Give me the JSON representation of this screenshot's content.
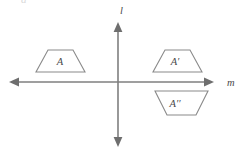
{
  "figure": {
    "background_color": "#ffffff",
    "line_color": "#7f7f7f",
    "shape_stroke_color": "#8a8a8a",
    "label_color": "#4a4a4a",
    "width": 247,
    "height": 155,
    "partial_glyph_top": "a"
  },
  "axes": {
    "origin": {
      "x": 118,
      "y": 82
    },
    "vertical": {
      "label": "l",
      "label_x": 120,
      "label_y": 14,
      "x": 118,
      "y_top": 22,
      "y_bottom": 147,
      "arrow_top": true,
      "arrow_bottom": true
    },
    "horizontal": {
      "label": "m",
      "label_x": 227,
      "label_y": 86,
      "y": 82,
      "x_left": 9,
      "x_right": 214,
      "arrow_left": true,
      "arrow_right": true
    }
  },
  "shapes": [
    {
      "name": "trapezoid-a",
      "label": "A",
      "primes": "",
      "quadrant": "II",
      "orientation": "narrow-top",
      "points": "48,50 73,50 85,72 36,72",
      "label_x": 60,
      "label_y": 65
    },
    {
      "name": "trapezoid-a-prime",
      "label": "A",
      "primes": "′",
      "quadrant": "I",
      "orientation": "narrow-top",
      "points": "165,50 190,50 202,72 153,72",
      "label_x": 175,
      "label_y": 65
    },
    {
      "name": "trapezoid-a-double-prime",
      "label": "A",
      "primes": "′′",
      "quadrant": "IV",
      "orientation": "wide-top",
      "points": "155,91 208,91 196,115 167,115",
      "label_x": 175,
      "label_y": 107
    }
  ]
}
